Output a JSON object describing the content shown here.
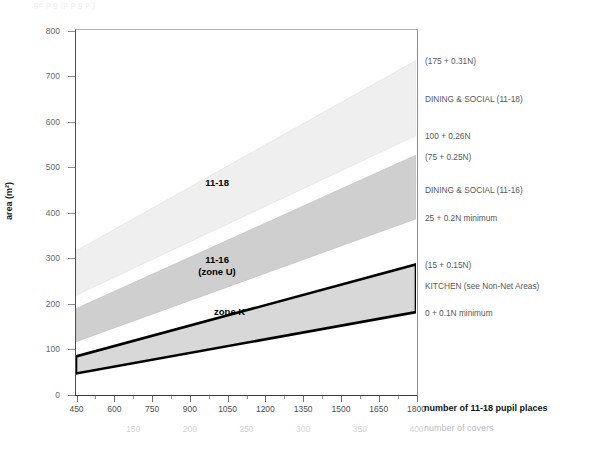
{
  "figure": {
    "faint_header": "ge   p                 g   (p   p   g   p  )",
    "background": "#ffffff"
  },
  "chart_data": {
    "type": "area",
    "title": "",
    "subtitle": "",
    "xlabel": "number of 11-18 pupil places",
    "ylabel": "area (m²)",
    "secondary_xlabel": "number of covers",
    "xlim": [
      450,
      1800
    ],
    "ylim": [
      0,
      800
    ],
    "grid": false,
    "legend_position": "in-plot annotations + right-side notes",
    "xticks": [
      450,
      600,
      750,
      900,
      1050,
      1200,
      1350,
      1500,
      1650,
      1800
    ],
    "xtick_labels": [
      "450",
      "600",
      "750",
      "900",
      "1050",
      "1200",
      "1350",
      "1500",
      "1650",
      "1800"
    ],
    "yticks": [
      0,
      100,
      200,
      300,
      400,
      500,
      600,
      700,
      800
    ],
    "ytick_labels": [
      "0",
      "100",
      "200",
      "300",
      "400",
      "500",
      "600",
      "700",
      "800"
    ],
    "secondary_xticks": [
      150,
      200,
      250,
      300,
      350,
      400
    ],
    "secondary_xtick_labels": [
      "150",
      "200",
      "250",
      "300",
      "350",
      "400"
    ],
    "secondary_axis_mapping": "covers = pupil places / 4.5",
    "bands": [
      {
        "name": "11-18",
        "in_plot_label": "11-18",
        "fill": "#efefef",
        "stroke": "#e3e3e3",
        "upper_formula": "175 + 0.31N",
        "lower_formula": "100 + 0.26N",
        "upper_intercept": 175,
        "upper_slope": 0.31,
        "lower_intercept": 100,
        "lower_slope": 0.26,
        "upper_at_xmin": 314.5,
        "upper_at_xmax": 733.0,
        "lower_at_xmin": 217.0,
        "lower_at_xmax": 568.0
      },
      {
        "name": "11-16 (zone U)",
        "in_plot_label_line1": "11-16",
        "in_plot_label_line2": "(zone U)",
        "fill": "#cfcfcf",
        "stroke": "#c4c4c4",
        "upper_formula": "75 + 0.25N",
        "lower_formula": "25 + 0.2N minimum",
        "upper_intercept": 75,
        "upper_slope": 0.25,
        "lower_intercept": 25,
        "lower_slope": 0.2,
        "upper_at_xmin": 187.5,
        "upper_at_xmax": 525.0,
        "lower_at_xmin": 115.0,
        "lower_at_xmax": 385.0
      },
      {
        "name": "zone K",
        "in_plot_label": "zone K",
        "fill": "#d8d8d8",
        "stroke": "#000000",
        "upper_formula": "15 + 0.15N",
        "lower_formula": "0 + 0.1N minimum",
        "upper_intercept": 15,
        "upper_slope": 0.15,
        "lower_intercept": 0,
        "lower_slope": 0.1,
        "upper_at_xmin": 82.5,
        "upper_at_xmax": 285.0,
        "lower_at_xmin": 45.0,
        "lower_at_xmax": 180.0
      }
    ],
    "annotations": [
      {
        "text": "(175 + 0.31N)",
        "y_value": 733
      },
      {
        "text": "DINING & SOCIAL (11-18)",
        "y_value": 650
      },
      {
        "text": "100 + 0.26N",
        "y_value": 568
      },
      {
        "text": "(75 + 0.25N)",
        "y_value": 521
      },
      {
        "text": "DINING & SOCIAL (11-16)",
        "y_value": 450
      },
      {
        "text": "25 + 0.2N minimum",
        "y_value": 388
      },
      {
        "text": "(15 + 0.15N)",
        "y_value": 285
      },
      {
        "text": "KITCHEN (see Non-Net Areas)",
        "y_value": 238
      },
      {
        "text": "0 + 0.1N minimum",
        "y_value": 180
      }
    ]
  },
  "colors": {
    "band_11_18": "#efefef",
    "band_11_16": "#cfcfcf",
    "band_zone_k": "#d8d8d8",
    "zone_k_border": "#000000",
    "axis_text": "#4c4f52",
    "covers_text": "#d2d5d8",
    "note_text": "#54585b"
  }
}
